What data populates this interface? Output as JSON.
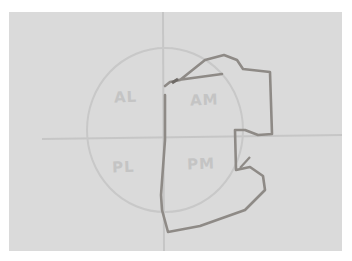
{
  "diagram": {
    "type": "hand-drawn quadrant sketch",
    "quadrants": [
      {
        "id": "AL",
        "label": "AL"
      },
      {
        "id": "AM",
        "label": "AM"
      },
      {
        "id": "PL",
        "label": "PL"
      },
      {
        "id": "PM",
        "label": "PM"
      }
    ],
    "colors": {
      "paper": "#dadada",
      "border": "#ffffff",
      "pencil_light": "#c2c2c2",
      "trace_dark": "#8e8a86"
    }
  }
}
